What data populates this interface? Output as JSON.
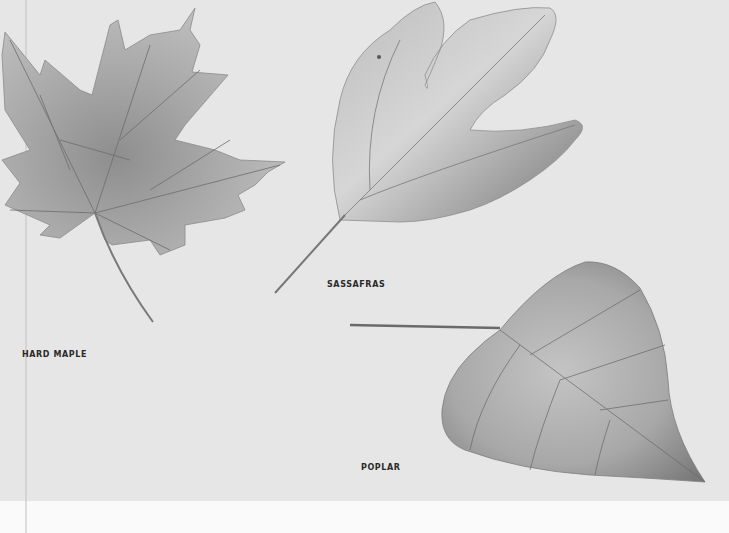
{
  "plate": {
    "background_color": "#e6e6e6",
    "lower_strip_color": "#fafafa",
    "leaves": [
      {
        "name": "hard-maple",
        "label": "HARD MAPLE"
      },
      {
        "name": "sassafras",
        "label": "SASSAFRAS"
      },
      {
        "name": "poplar",
        "label": "POPLAR"
      }
    ]
  }
}
